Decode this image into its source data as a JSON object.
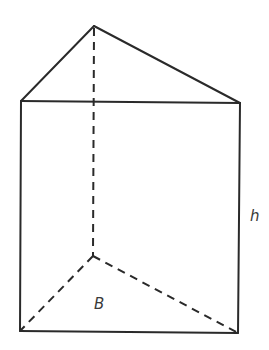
{
  "diagram": {
    "type": "triangular-prism",
    "labels": {
      "base": "B",
      "height": "h"
    },
    "colors": {
      "stroke": "#2a2a2a",
      "label": "#3a3a3a",
      "background": "#ffffff"
    },
    "vertices": {
      "top_back": [
        94,
        26
      ],
      "top_left": [
        21,
        101
      ],
      "top_right": [
        240,
        103
      ],
      "bottom_back": [
        93,
        256
      ],
      "bottom_left": [
        20,
        331
      ],
      "bottom_right": [
        238,
        333
      ]
    }
  }
}
